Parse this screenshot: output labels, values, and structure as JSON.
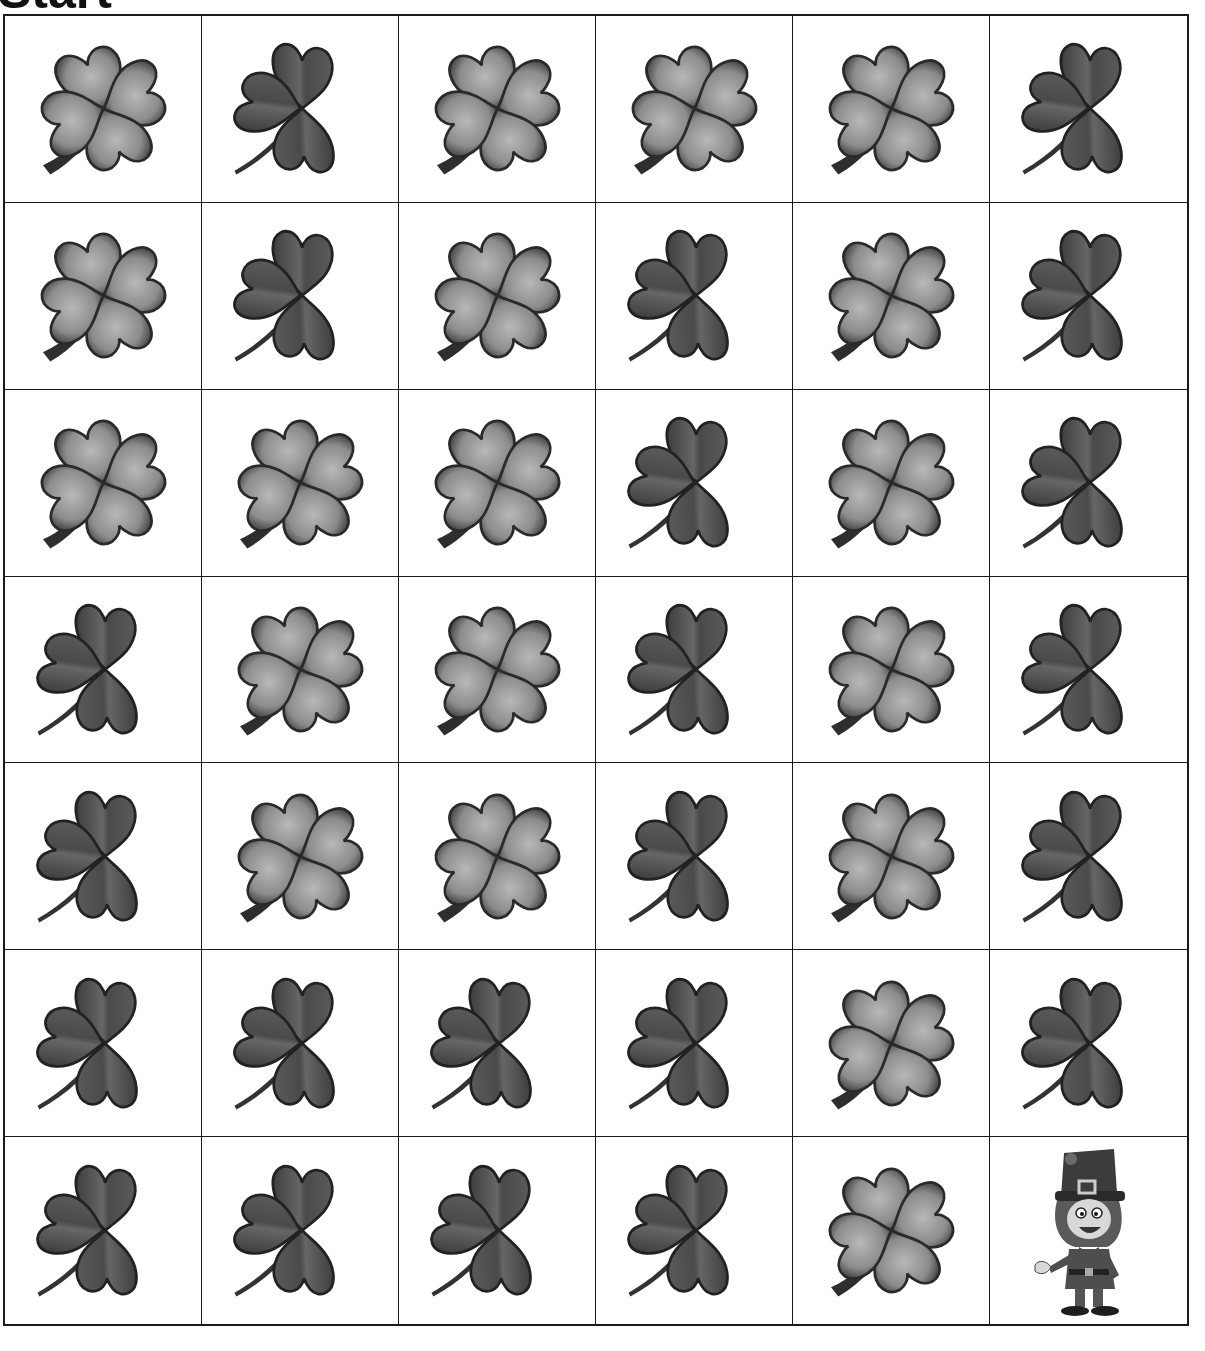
{
  "worksheet": {
    "title": "Start",
    "goal_label": "leprechaun"
  },
  "colors": {
    "four_leaf_fill": "#8a8a8a",
    "four_leaf_edge": "#2a2a2a",
    "three_leaf_fill": "#555555",
    "three_leaf_edge": "#222222",
    "grid_line": "#1a1a1a"
  },
  "grid": {
    "rows": 7,
    "cols": 6,
    "cells": [
      [
        "four-leaf-clover",
        "three-leaf-clover",
        "four-leaf-clover",
        "four-leaf-clover",
        "four-leaf-clover",
        "three-leaf-clover"
      ],
      [
        "four-leaf-clover",
        "three-leaf-clover",
        "four-leaf-clover",
        "three-leaf-clover",
        "four-leaf-clover",
        "three-leaf-clover"
      ],
      [
        "four-leaf-clover",
        "four-leaf-clover",
        "four-leaf-clover",
        "three-leaf-clover",
        "four-leaf-clover",
        "three-leaf-clover"
      ],
      [
        "three-leaf-clover",
        "four-leaf-clover",
        "four-leaf-clover",
        "three-leaf-clover",
        "four-leaf-clover",
        "three-leaf-clover"
      ],
      [
        "three-leaf-clover",
        "four-leaf-clover",
        "four-leaf-clover",
        "three-leaf-clover",
        "four-leaf-clover",
        "three-leaf-clover"
      ],
      [
        "three-leaf-clover",
        "three-leaf-clover",
        "three-leaf-clover",
        "three-leaf-clover",
        "four-leaf-clover",
        "three-leaf-clover"
      ],
      [
        "three-leaf-clover",
        "three-leaf-clover",
        "three-leaf-clover",
        "three-leaf-clover",
        "four-leaf-clover",
        "leprechaun"
      ]
    ]
  }
}
